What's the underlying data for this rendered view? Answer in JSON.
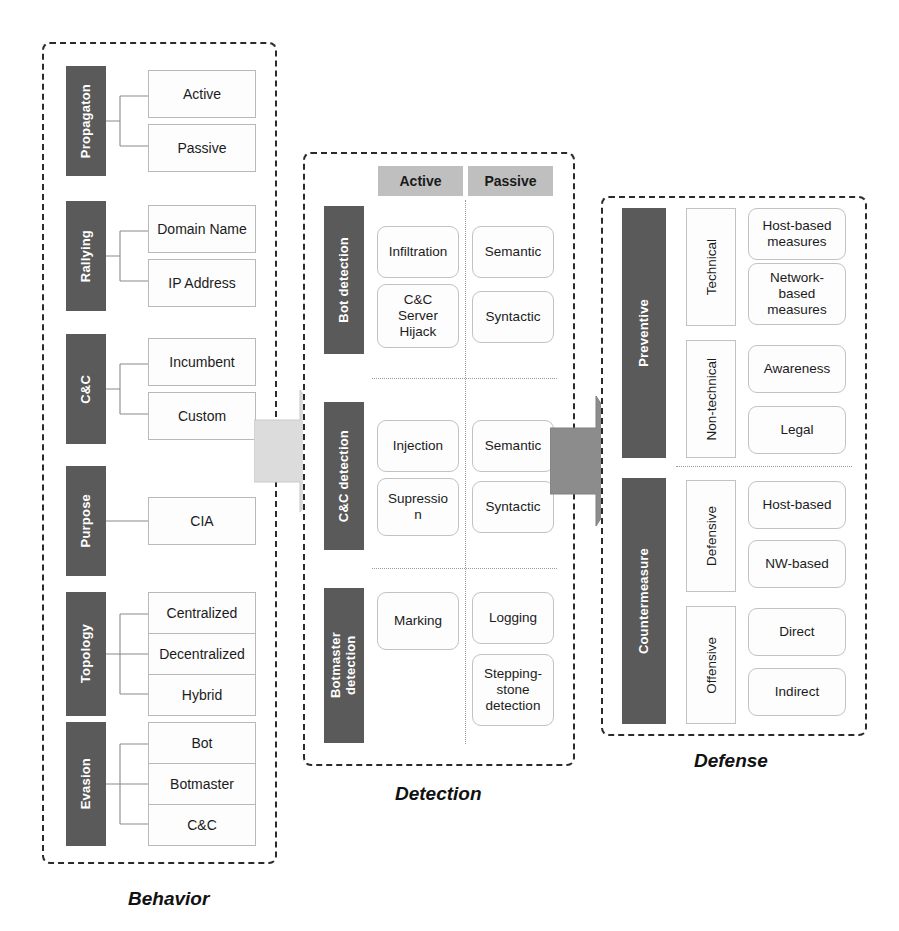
{
  "diagram": {
    "colors": {
      "dark_bar": "#5a5a5a",
      "header_gray": "#bfbfbf",
      "arrow_light": "#d9d9d9",
      "arrow_dark": "#8c8c8c",
      "frame_border": "#2b2b2b",
      "box_border": "#c2c2c2",
      "text": "#1a1a1a"
    }
  },
  "behavior": {
    "caption": "Behavior",
    "categories": [
      {
        "label": "Propagaton",
        "items": [
          "Active",
          "Passive"
        ]
      },
      {
        "label": "Rallying",
        "items": [
          "Domain Name",
          "IP Address"
        ]
      },
      {
        "label": "C&C",
        "items": [
          "Incumbent",
          "Custom"
        ]
      },
      {
        "label": "Purpose",
        "items": [
          "CIA"
        ]
      },
      {
        "label": "Topology",
        "items": [
          "Centralized",
          "Decentralized",
          "Hybrid"
        ]
      },
      {
        "label": "Evasion",
        "items": [
          "Bot",
          "Botmaster",
          "C&C"
        ]
      }
    ]
  },
  "detection": {
    "caption": "Detection",
    "column_headers": [
      "Active",
      "Passive"
    ],
    "rows": [
      {
        "label": "Bot detection",
        "active": [
          "Infiltration",
          "C&C\nServer\nHijack"
        ],
        "passive": [
          "Semantic",
          "Syntactic"
        ]
      },
      {
        "label": "C&C detection",
        "active": [
          "Injection",
          "Supressio\nn"
        ],
        "passive": [
          "Semantic",
          "Syntactic"
        ]
      },
      {
        "label": "Botmaster\ndetection",
        "active": [
          "Marking"
        ],
        "passive": [
          "Logging",
          "Stepping-\nstone\ndetection"
        ]
      }
    ]
  },
  "defense": {
    "caption": "Defense",
    "groups": [
      {
        "label": "Preventive",
        "subgroups": [
          {
            "label": "Technical",
            "items": [
              "Host-based\nmeasures",
              "Network-\nbased\nmeasures"
            ]
          },
          {
            "label": "Non-technical",
            "items": [
              "Awareness",
              "Legal"
            ]
          }
        ]
      },
      {
        "label": "Countermeasure",
        "subgroups": [
          {
            "label": "Defensive",
            "items": [
              "Host-based",
              "NW-based"
            ]
          },
          {
            "label": "Offensive",
            "items": [
              "Direct",
              "Indirect"
            ]
          }
        ]
      }
    ]
  },
  "arrows": [
    {
      "name": "behavior-to-detection",
      "color": "#d9d9d9"
    },
    {
      "name": "detection-to-defense",
      "color": "#8c8c8c"
    }
  ]
}
